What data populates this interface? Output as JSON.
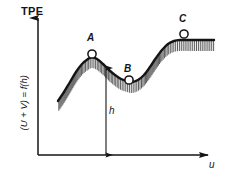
{
  "figure": {
    "name": "total-potential-energy-curve",
    "background_color": "#ffffff",
    "ink_color": "#141414"
  },
  "axes": {
    "y_top_label": "TPE",
    "y_axis_label": "(U + V) = f(h)",
    "x_axis_label": "u",
    "origin": {
      "x": 38,
      "y": 155
    },
    "y_tip": {
      "x": 38,
      "y": 12
    },
    "x_tip": {
      "x": 215,
      "y": 155
    },
    "grid": false
  },
  "annotations": {
    "point_A": {
      "label": "A",
      "x": 92,
      "y": 54,
      "marker": "open-circle"
    },
    "point_B": {
      "label": "B",
      "x": 129,
      "y": 80,
      "marker": "open-circle"
    },
    "point_C": {
      "label": "C",
      "x": 184,
      "y": 34,
      "marker": "open-circle"
    },
    "height_measure": {
      "label": "h",
      "top": {
        "x": 106,
        "y": 68
      },
      "bottom": {
        "x": 106,
        "y": 155
      }
    }
  },
  "chart_data": {
    "type": "line",
    "title": "",
    "subtitle": "",
    "xlabel": "u",
    "ylabel": "(U + V) = f(h)",
    "ylim": [
      0,
      1
    ],
    "xlim": [
      0,
      1
    ],
    "grid": false,
    "legend_position": "none",
    "hatched_below_curve": true,
    "series": [
      {
        "name": "total potential energy",
        "comment": "energy curve: rise to local max A, dip to local min B, rise to plateau through C",
        "x": [
          58,
          64,
          70,
          76,
          82,
          88,
          92,
          97,
          103,
          109,
          115,
          121,
          127,
          132,
          138,
          144,
          150,
          156,
          162,
          168,
          174,
          180,
          190,
          200,
          214
        ],
        "y": [
          101,
          92,
          82,
          72,
          64,
          59,
          57,
          59,
          64,
          70,
          75,
          79,
          81,
          82,
          80,
          75,
          67,
          58,
          50,
          44,
          41,
          40,
          40,
          40,
          40
        ]
      }
    ],
    "annotations": [
      {
        "text": "A",
        "x": 92,
        "y": 57,
        "role": "local-maximum-unstable-equilibrium"
      },
      {
        "text": "B",
        "x": 132,
        "y": 82,
        "role": "local-minimum-stable-equilibrium"
      },
      {
        "text": "C",
        "x": 184,
        "y": 40,
        "role": "plateau-neutral-equilibrium"
      },
      {
        "text": "h",
        "x": 106,
        "y": 110,
        "role": "displacement-measure"
      }
    ]
  }
}
